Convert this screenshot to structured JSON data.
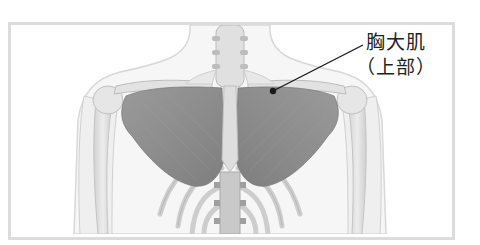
{
  "diagram": {
    "annotation": {
      "label_main": "胸大肌",
      "label_sub": "（上部）",
      "pointer": {
        "dot": [
          273,
          91
        ],
        "end": [
          363,
          45
        ]
      }
    },
    "colors": {
      "frame": "#dcdcdc",
      "muscle": "#8e8e8e",
      "bone": "#e4e4e4",
      "bone_outline": "#c8c8c8",
      "skin_outline": "#d8d8d8",
      "pointer": "#1a1a1a",
      "text": "#222222"
    }
  }
}
